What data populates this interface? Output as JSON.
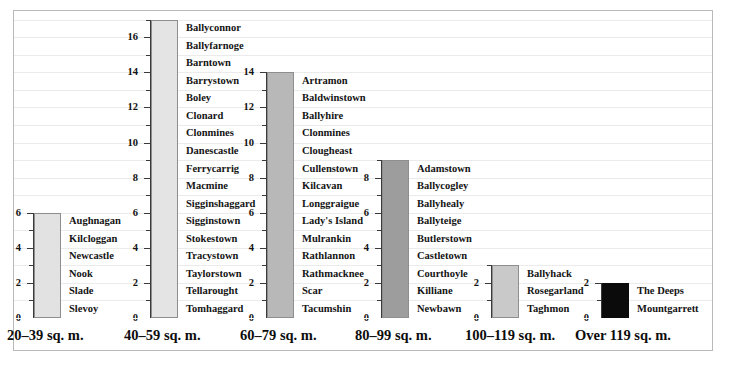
{
  "chart_data": {
    "type": "bar",
    "title": "",
    "subtitle": "",
    "xlabel": "",
    "ylabel": "",
    "ylim": [
      0,
      17
    ],
    "ytick_step": 2,
    "yminor_step": 1,
    "grid": true,
    "legend": "none",
    "note": "Each category has its own y-axis; bar height equals the count of townland names listed beside it.",
    "categories": [
      "20–39 sq. m.",
      "40–59 sq. m.",
      "60–79 sq. m.",
      "80–99 sq. m.",
      "100–119 sq. m.",
      "Over 119 sq. m."
    ],
    "values": [
      6,
      17,
      14,
      9,
      3,
      2
    ],
    "axis_max": [
      6,
      17,
      14,
      9,
      3,
      2
    ],
    "bar_colors": [
      "#e2e2e2",
      "#e4e4e4",
      "#b8b8b8",
      "#9d9d9d",
      "#c9c9c9",
      "#0b0b0b"
    ],
    "groups": [
      {
        "category": "20–39 sq. m.",
        "value": 6,
        "axis_labels": [
          "0",
          "2",
          "4",
          "6"
        ],
        "names": [
          "Aughnagan",
          "Kilcloggan",
          "Newcastle",
          "Nook",
          "Slade",
          "Slevoy"
        ]
      },
      {
        "category": "40–59 sq. m.",
        "value": 17,
        "axis_labels": [
          "0",
          "2",
          "4",
          "6",
          "8",
          "10",
          "12",
          "14",
          "16"
        ],
        "names": [
          "Ballyconnor",
          "Ballyfarnoge",
          "Barntown",
          "Barrystown",
          "Boley",
          "Clonard",
          "Clonmines",
          "Danescastle",
          "Ferrycarrig",
          "Macmine",
          "Sigginshaggard",
          "Sigginstown",
          "Stokestown",
          "Tracystown",
          "Taylorstown",
          "Tellarought",
          "Tomhaggard"
        ]
      },
      {
        "category": "60–79 sq. m.",
        "value": 14,
        "axis_labels": [
          "0",
          "2",
          "4",
          "6",
          "8",
          "10",
          "12",
          "14"
        ],
        "names": [
          "Artramon",
          "Baldwinstown",
          "Ballyhire",
          "Clonmines",
          "Clougheast",
          "Cullenstown",
          "Kilcavan",
          "Longgraigue",
          "Lady's Island",
          "Mulrankin",
          "Rathlannon",
          "Rathmacknee",
          "Scar",
          "Tacumshin"
        ]
      },
      {
        "category": "80–99 sq. m.",
        "value": 9,
        "axis_labels": [
          "0",
          "2",
          "4",
          "6",
          "8"
        ],
        "names": [
          "Adamstown",
          "Ballycogley",
          "Ballyhealy",
          "Ballyteige",
          "Butlerstown",
          "Castletown",
          "Courthoyle",
          "Killiane",
          "Newbawn"
        ]
      },
      {
        "category": "100–119 sq. m.",
        "value": 3,
        "axis_labels": [
          "0",
          "2"
        ],
        "names": [
          "Ballyhack",
          "Rosegarland",
          "Taghmon"
        ]
      },
      {
        "category": "Over 119 sq. m.",
        "value": 2,
        "axis_labels": [
          "0",
          "2"
        ],
        "names": [
          "The Deeps",
          "Mountgarrett"
        ]
      }
    ]
  },
  "layout": {
    "group_x": [
      33,
      150,
      266,
      381,
      491,
      601
    ],
    "bar_width": 27,
    "name_offset": 8,
    "plot_bottom": 318,
    "unit_px": 17.55,
    "grid_count": 17
  }
}
